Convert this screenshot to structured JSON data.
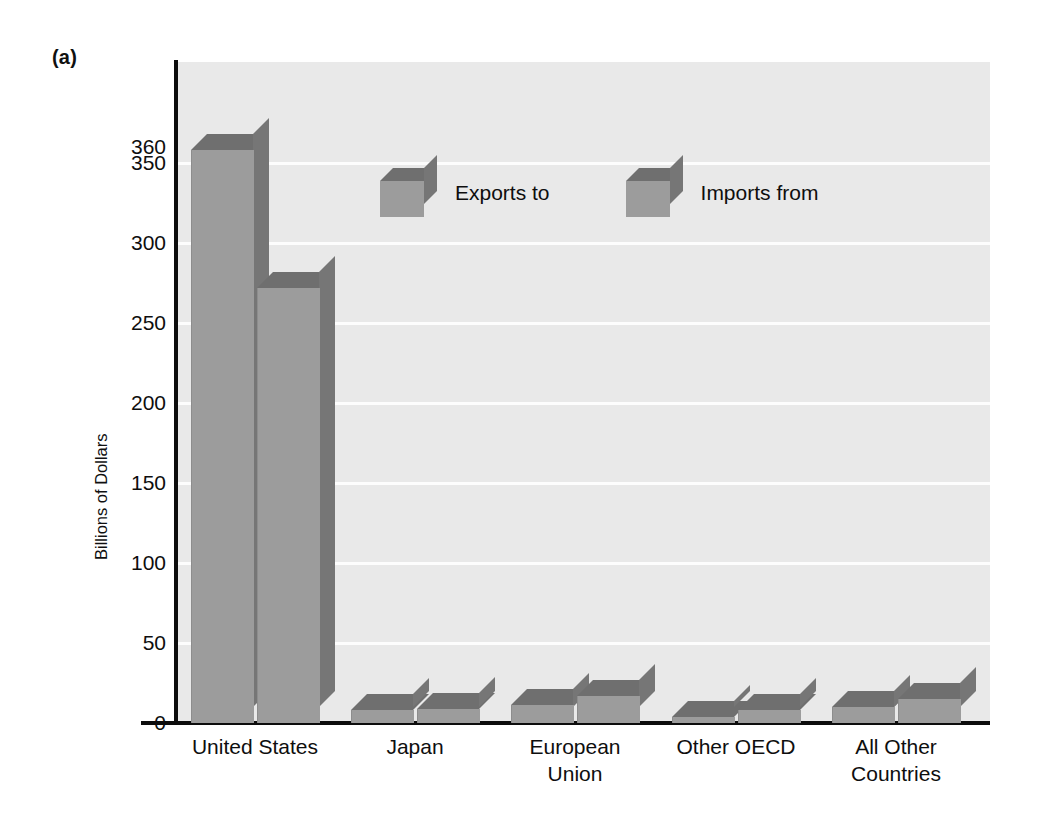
{
  "panel": {
    "label": "(a)"
  },
  "chart_data": {
    "type": "bar",
    "title": "",
    "subtitle": "",
    "panel_label": "(a)",
    "xlabel": "",
    "ylabel": "Billions of Dollars",
    "categories": [
      "United States",
      "Japan",
      "European Union",
      "Other OECD",
      "All Other Countries"
    ],
    "category_lines": [
      [
        "United States"
      ],
      [
        "Japan"
      ],
      [
        "European",
        "Union"
      ],
      [
        "Other OECD"
      ],
      [
        "All Other",
        "Countries"
      ]
    ],
    "series": [
      {
        "name": "Exports to",
        "values": [
          358,
          8,
          11,
          4,
          10
        ]
      },
      {
        "name": "Imports from",
        "values": [
          272,
          9,
          17,
          8,
          15
        ]
      }
    ],
    "ylim": [
      0,
      360
    ],
    "yticks": [
      0,
      50,
      100,
      150,
      200,
      250,
      300,
      350,
      360
    ],
    "ytick_labels": [
      "0",
      "50",
      "100",
      "150",
      "200",
      "250",
      "300",
      "350",
      "360"
    ],
    "grid": true,
    "grid_axis": "y",
    "legend_position": "upper-center",
    "style": "3d-bar",
    "colors": {
      "bar_front": "#9c9c9c",
      "bar_top": "#6f6f6f",
      "bar_side": "#767676",
      "plot_background": "#e9e9e9",
      "gridline": "#fdfdfd",
      "axis": "#0c0c0c",
      "text": "#0e0e0e",
      "page_background": "#ffffff"
    }
  },
  "legend": {
    "items": [
      {
        "label": "Exports to"
      },
      {
        "label": "Imports from"
      }
    ]
  },
  "axis": {
    "y_title": "Billions of Dollars",
    "y_ticks": [
      "360",
      "350",
      "300",
      "250",
      "200",
      "150",
      "100",
      "50",
      "0"
    ]
  },
  "categories": [
    {
      "line1": "United States",
      "line2": ""
    },
    {
      "line1": "Japan",
      "line2": ""
    },
    {
      "line1": "European",
      "line2": "Union"
    },
    {
      "line1": "Other OECD",
      "line2": ""
    },
    {
      "line1": "All Other",
      "line2": "Countries"
    }
  ]
}
